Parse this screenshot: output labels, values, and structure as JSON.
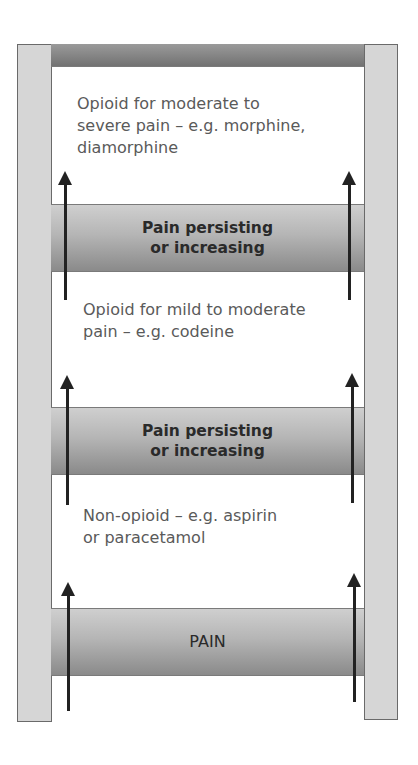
{
  "diagram": {
    "rungs": [
      {
        "id": "top",
        "label_line1": "",
        "label_line2": ""
      },
      {
        "id": "persist-upper",
        "label_line1": "Pain persisting",
        "label_line2": "or increasing"
      },
      {
        "id": "persist-lower",
        "label_line1": "Pain persisting",
        "label_line2": "or increasing"
      },
      {
        "id": "pain",
        "label_line1": "PAIN",
        "label_line2": ""
      }
    ],
    "steps": [
      {
        "line1": "Opioid for moderate to",
        "line2": "severe pain – e.g. morphine,",
        "line3": "diamorphine"
      },
      {
        "line1": "Opioid for mild to moderate",
        "line2": "pain – e.g. codeine"
      },
      {
        "line1": "Non-opioid – e.g. aspirin",
        "line2": "or paracetamol"
      }
    ],
    "colors": {
      "rail": "#d6d6d6",
      "rung_dark": "#8a8a8a",
      "rung_light": "#cfcfcf",
      "arrow": "#222222",
      "step_text": "#5a5a5a"
    }
  }
}
